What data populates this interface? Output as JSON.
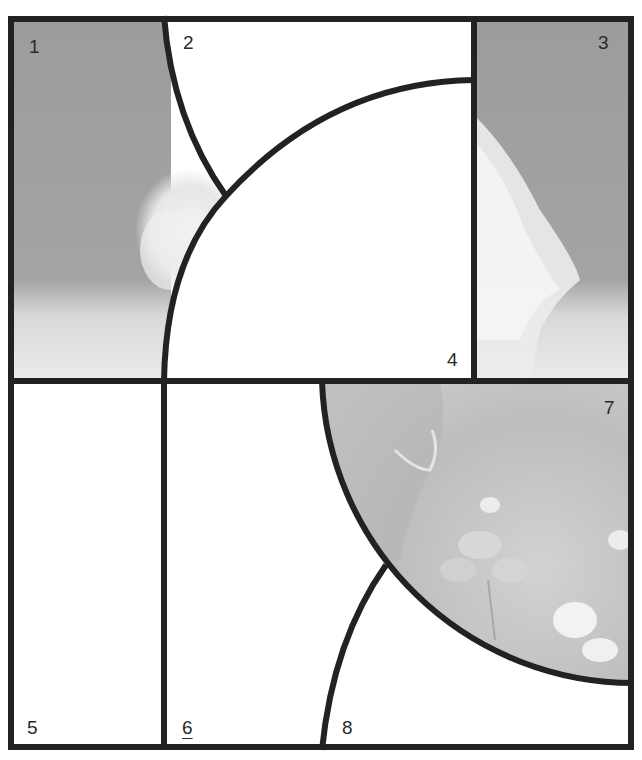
{
  "diagram": {
    "type": "jigsaw-puzzle-layout",
    "frame_color": "#222222",
    "photo_sky_color": "#9a9a9a",
    "photo_ground_color": "#e6e6e6",
    "clover_photo_color": "#c4c4c4",
    "pieces": [
      {
        "id": "1",
        "label": "1",
        "fill": "photo",
        "content": "grey sky, white dog fur tuft, light ground"
      },
      {
        "id": "2",
        "label": "2",
        "fill": "blank"
      },
      {
        "id": "3",
        "label": "3",
        "fill": "photo",
        "content": "grey sky, white dog fur, light ground"
      },
      {
        "id": "4",
        "label": "4",
        "fill": "blank"
      },
      {
        "id": "5",
        "label": "5",
        "fill": "blank"
      },
      {
        "id": "6",
        "label": "6",
        "fill": "blank",
        "underlined": true
      },
      {
        "id": "7",
        "label": "7",
        "fill": "photo",
        "content": "dog collar and clover flowers"
      },
      {
        "id": "8",
        "label": "8",
        "fill": "blank"
      }
    ]
  }
}
